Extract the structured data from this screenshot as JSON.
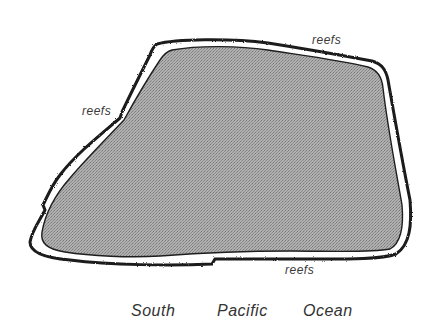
{
  "diagram": {
    "type": "island-map",
    "island": {
      "fill": "#a9a9a9",
      "outline": "#1e1e1e"
    },
    "reef": {
      "color": "#1a1a1a"
    },
    "labels": {
      "reef_top": "reefs",
      "reef_left": "reefs",
      "reef_bottom": "reefs",
      "ocean_word_1": "South",
      "ocean_word_2": "Pacific",
      "ocean_word_3": "Ocean"
    }
  }
}
